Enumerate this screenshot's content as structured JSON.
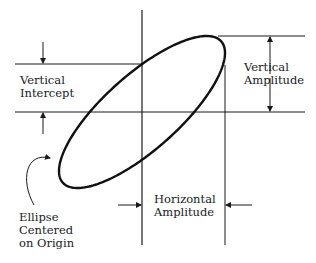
{
  "diagram": {
    "labels": {
      "vertical_intercept": [
        "Vertical",
        "Intercept"
      ],
      "vertical_amplitude": [
        "Vertical",
        "Amplitude"
      ],
      "horizontal_amplitude": [
        "Horizontal",
        "Amplitude"
      ],
      "ellipse_note": [
        "Ellipse",
        "Centered",
        "on Origin"
      ]
    },
    "geometry": {
      "origin": [
        142,
        112
      ],
      "horizontal_amplitude_px": 83,
      "vertical_amplitude_px": 76,
      "vertical_intercept_px": 48,
      "phase_deg": 39
    },
    "colors": {
      "line": "#1a1a1a",
      "background": "#ffffff"
    }
  }
}
